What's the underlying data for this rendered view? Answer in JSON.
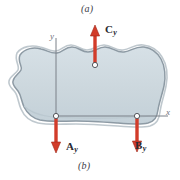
{
  "figure": {
    "caption_top": "(a)",
    "caption_bottom": "(b)",
    "body_fill_color": "#ccd7dd",
    "body_outline_color": "#8d9aa4",
    "arrow_color": "#d23c2a",
    "arrow_outline_color": "#9e2718",
    "axis_color": "#7b8088",
    "background_color": "#ffffff"
  },
  "axes": {
    "x_label": "x",
    "y_label": "y",
    "origin_name": "origin"
  },
  "forces": [
    {
      "id": "cy",
      "letter": "C",
      "subscript": "y",
      "direction": "up",
      "application_point": "top-support"
    },
    {
      "id": "ay",
      "letter": "A",
      "subscript": "y",
      "direction": "down",
      "application_point": "left-support"
    },
    {
      "id": "by",
      "letter": "B",
      "subscript": "y",
      "direction": "down",
      "application_point": "right-support"
    }
  ]
}
